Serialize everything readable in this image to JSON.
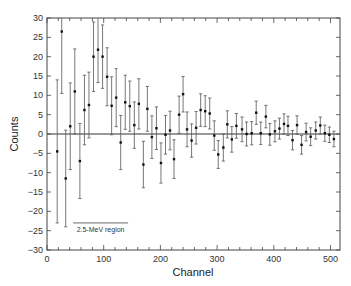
{
  "chart_data": {
    "type": "scatter",
    "title": "",
    "xlabel": "Channel",
    "ylabel": "Counts",
    "xlim": [
      0,
      520
    ],
    "ylim": [
      -30,
      30
    ],
    "x_ticks": [
      0,
      100,
      200,
      300,
      400,
      500
    ],
    "x_tick_labels": [
      "0",
      "100",
      "200",
      "300",
      "400",
      "500"
    ],
    "y_ticks": [
      -30,
      -25,
      -20,
      -15,
      -10,
      -5,
      0,
      5,
      10,
      15,
      20,
      25,
      30
    ],
    "y_tick_labels": [
      "−30",
      "−25",
      "−20",
      "−15",
      "−10",
      "−5",
      "0",
      "5",
      "10",
      "15",
      "20",
      "25",
      "30"
    ],
    "grid": false,
    "zero_line": true,
    "legend": null,
    "annotations": [
      {
        "text": "2.5-MeV region",
        "x_start": 46,
        "x_end": 143,
        "y_line": -23.0,
        "y_text": -24.5
      }
    ],
    "series": [
      {
        "name": "counts",
        "x": [
          18,
          26,
          33,
          41,
          49,
          58,
          66,
          74,
          82,
          90,
          98,
          106,
          114,
          122,
          130,
          138,
          146,
          154,
          162,
          170,
          177,
          185,
          193,
          201,
          209,
          217,
          224,
          233,
          240,
          247,
          255,
          263,
          271,
          279,
          287,
          295,
          302,
          311,
          318,
          326,
          334,
          344,
          352,
          361,
          369,
          377,
          386,
          393,
          402,
          410,
          418,
          425,
          433,
          441,
          449,
          457,
          465,
          474,
          482,
          490,
          498,
          506
        ],
        "y": [
          -4.5,
          26.5,
          -11.5,
          2.0,
          11.0,
          -7.0,
          6.2,
          7.5,
          20.0,
          21.8,
          20.0,
          14.8,
          7.3,
          9.4,
          -2.2,
          8.2,
          7.2,
          2.3,
          7.8,
          -7.9,
          6.5,
          -0.8,
          1.5,
          -7.5,
          -0.2,
          0.9,
          -6.5,
          5.0,
          10.3,
          1.2,
          -1.7,
          1.6,
          6.2,
          5.9,
          5.3,
          -0.4,
          -5.3,
          -3.5,
          2.5,
          -1.4,
          2.1,
          1.2,
          0.0,
          0.2,
          5.5,
          0.2,
          4.5,
          -0.1,
          0.7,
          1.4,
          2.6,
          2.1,
          -1.6,
          2.3,
          -2.8,
          0.5,
          -0.7,
          0.9,
          2.2,
          0.2,
          -0.2,
          -1.3
        ],
        "yerr": [
          18.5,
          16.0,
          12.5,
          11.2,
          11.0,
          9.7,
          9.0,
          8.5,
          9.0,
          8.5,
          8.2,
          7.5,
          7.5,
          7.5,
          7.0,
          7.0,
          6.5,
          6.0,
          6.5,
          6.0,
          5.8,
          5.5,
          5.5,
          5.2,
          5.0,
          5.0,
          5.0,
          4.8,
          4.6,
          4.5,
          4.3,
          4.2,
          4.2,
          4.0,
          4.0,
          3.8,
          3.6,
          3.5,
          3.5,
          3.3,
          3.2,
          3.2,
          3.1,
          3.0,
          3.0,
          2.9,
          2.9,
          2.8,
          2.7,
          2.7,
          2.6,
          2.5,
          2.5,
          2.4,
          2.4,
          2.3,
          2.3,
          2.2,
          2.2,
          2.1,
          2.0,
          2.0
        ]
      }
    ]
  }
}
